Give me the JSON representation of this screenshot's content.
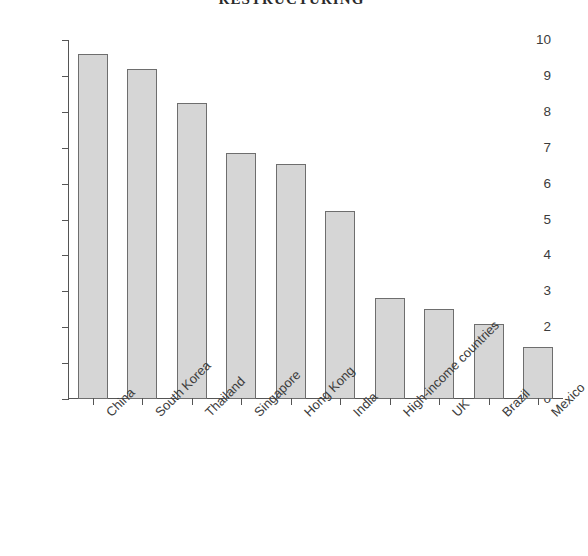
{
  "title": "RESTRUCTURING",
  "chart_data": {
    "type": "bar",
    "title": "RESTRUCTURING",
    "subtitle": "",
    "xlabel": "",
    "ylabel": "Average annual growth rate (%)",
    "categories": [
      "China",
      "South Korea",
      "Thailand",
      "Singapore",
      "Hong Kong",
      "India",
      "High-income countries",
      "UK",
      "Brazil",
      "Mexico"
    ],
    "values": [
      9.6,
      9.2,
      8.25,
      6.85,
      6.55,
      5.25,
      2.8,
      2.5,
      2.1,
      1.45
    ],
    "ylim": [
      0,
      10
    ],
    "ytick_labels": [
      "0",
      "1",
      "2",
      "3",
      "4",
      "5",
      "6",
      "7",
      "8",
      "9",
      "10"
    ],
    "ytick_values": [
      0,
      1,
      2,
      3,
      4,
      5,
      6,
      7,
      8,
      9,
      10
    ],
    "grid": false,
    "legend": false,
    "legend_position": "none",
    "bar_fill_color": "#d6d6d6",
    "bar_edge_color": "#6e6e6e",
    "axis_color": "#555555",
    "xtick_label_rotation": -45
  }
}
